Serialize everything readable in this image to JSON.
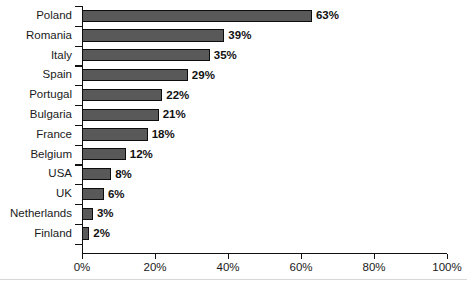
{
  "chart_data": {
    "type": "bar",
    "orientation": "horizontal",
    "title": "",
    "subtitle": "",
    "xlabel": "",
    "ylabel": "",
    "xlim": [
      0,
      100
    ],
    "grid": false,
    "legend": null,
    "categories": [
      "Poland",
      "Romania",
      "Italy",
      "Spain",
      "Portugal",
      "Bulgaria",
      "France",
      "Belgium",
      "USA",
      "UK",
      "Netherlands",
      "Finland"
    ],
    "values": [
      63,
      39,
      35,
      29,
      22,
      21,
      18,
      12,
      8,
      6,
      3,
      2
    ],
    "data_labels": [
      "63%",
      "39%",
      "35%",
      "29%",
      "22%",
      "21%",
      "18%",
      "12%",
      "8%",
      "6%",
      "3%",
      "2%"
    ],
    "x_ticks": [
      0,
      20,
      40,
      60,
      80,
      100
    ],
    "x_tick_labels": [
      "0%",
      "20%",
      "40%",
      "60%",
      "80%",
      "100%"
    ],
    "bar_color": "#595959",
    "bar_border_color": "#0d0d0d",
    "axis_color": "#111111",
    "text_color": "#1a1a1a",
    "background": "#ffffff"
  }
}
